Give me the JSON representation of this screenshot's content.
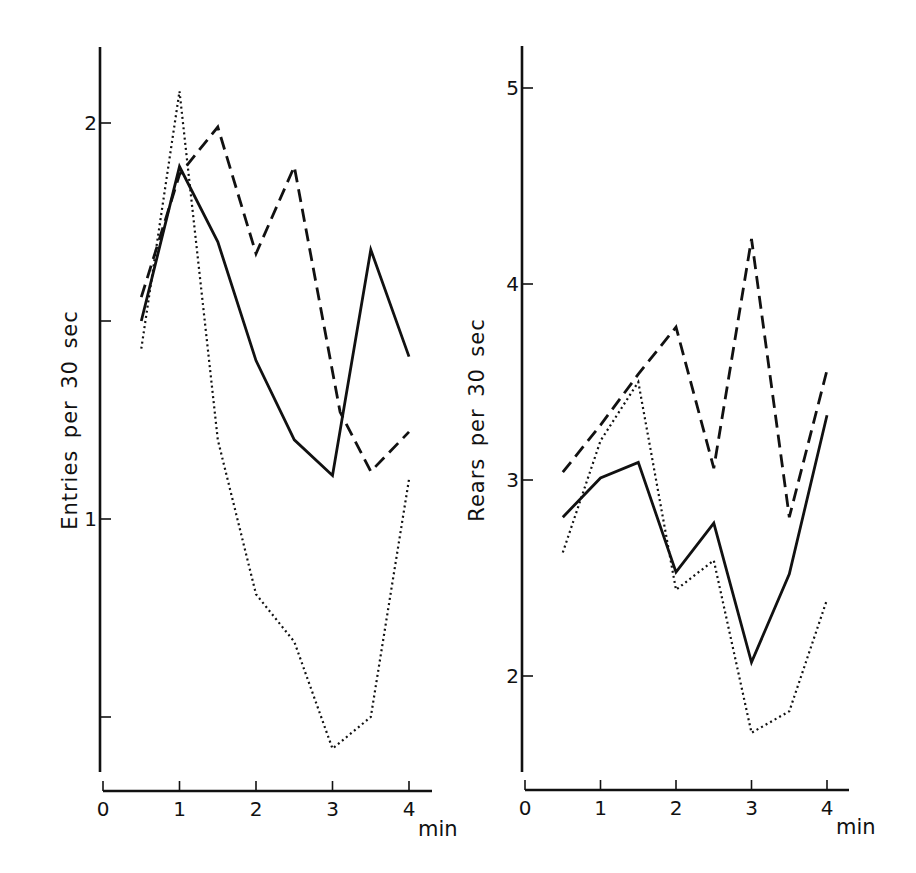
{
  "figure": {
    "ink_color": "#111111",
    "background": "#ffffff"
  },
  "chart_data": [
    {
      "type": "line",
      "ylabel": "Entries per 30 sec",
      "xlabel": "min",
      "x_ticks": [
        0,
        1,
        2,
        3,
        4
      ],
      "y_ticks": [
        {
          "value": 0.5,
          "label": ""
        },
        {
          "value": 1,
          "label": "1"
        },
        {
          "value": 1.5,
          "label": ""
        },
        {
          "value": 2,
          "label": "2"
        }
      ],
      "xlim": [
        0,
        4.3
      ],
      "ylim": [
        0.35,
        2.2
      ],
      "grid": false,
      "legend": null,
      "layout": {
        "x0px": 103,
        "px_per_x": 76.5,
        "y_ref_value": 1,
        "y_ref_px": 519,
        "px_per_y": 396,
        "yaxis_top": 47,
        "yaxis_bottom": 772,
        "xaxis_y": 791,
        "xaxis_right": 432,
        "ylabel_x": 77,
        "ylabel_y": 420,
        "unit_x": 418,
        "unit_y": 836
      },
      "series": [
        {
          "name": "solid",
          "style": "solid",
          "x": [
            0.5,
            1,
            1.5,
            2,
            2.5,
            3,
            3.5,
            4
          ],
          "values": [
            1.5,
            1.89,
            1.7,
            1.4,
            1.2,
            1.11,
            1.68,
            1.41
          ]
        },
        {
          "name": "dashed",
          "style": "dashed",
          "x": [
            0.5,
            1,
            1.5,
            2,
            2.5,
            3.1,
            3.5,
            4
          ],
          "values": [
            1.56,
            1.87,
            1.99,
            1.67,
            1.89,
            1.27,
            1.12,
            1.22
          ]
        },
        {
          "name": "dotted",
          "style": "dotted",
          "x": [
            0.5,
            1,
            1.5,
            2,
            2.5,
            3,
            3.5,
            4
          ],
          "values": [
            1.43,
            2.08,
            1.2,
            0.81,
            0.69,
            0.42,
            0.5,
            1.1
          ]
        }
      ]
    },
    {
      "type": "line",
      "ylabel": "Rears per 30 sec",
      "xlabel": "min",
      "x_ticks": [
        0,
        1,
        2,
        3,
        4
      ],
      "y_ticks": [
        {
          "value": 2,
          "label": "2"
        },
        {
          "value": 3,
          "label": "3"
        },
        {
          "value": 4,
          "label": "4"
        },
        {
          "value": 5,
          "label": "5"
        }
      ],
      "xlim": [
        0,
        4.3
      ],
      "ylim": [
        1.5,
        5.2
      ],
      "grid": false,
      "legend": null,
      "layout": {
        "x0px": 525,
        "px_per_x": 75.5,
        "y_ref_value": 3,
        "y_ref_px": 480,
        "px_per_y": 196,
        "yaxis_top": 46,
        "yaxis_bottom": 772,
        "xaxis_y": 790,
        "xaxis_right": 849,
        "ylabel_x": 484,
        "ylabel_y": 420,
        "unit_x": 836,
        "unit_y": 834
      },
      "series": [
        {
          "name": "solid",
          "style": "solid",
          "x": [
            0.5,
            1,
            1.5,
            2,
            2.5,
            3,
            3.5,
            4
          ],
          "values": [
            2.81,
            3.01,
            3.09,
            2.53,
            2.78,
            2.07,
            2.52,
            3.33
          ]
        },
        {
          "name": "dashed",
          "style": "dashed",
          "x": [
            0.5,
            1,
            1.5,
            2,
            2.5,
            3,
            3.5,
            4
          ],
          "values": [
            3.04,
            3.28,
            3.54,
            3.78,
            3.06,
            4.23,
            2.81,
            3.56
          ]
        },
        {
          "name": "dotted",
          "style": "dotted",
          "x": [
            0.5,
            1,
            1.5,
            2,
            2.5,
            3,
            3.5,
            4
          ],
          "values": [
            2.63,
            3.2,
            3.5,
            2.44,
            2.59,
            1.71,
            1.82,
            2.39
          ]
        }
      ]
    }
  ]
}
